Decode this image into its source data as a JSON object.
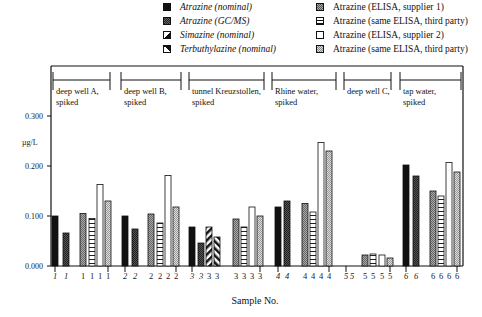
{
  "chart_data": {
    "type": "bar",
    "title": "",
    "xlabel": "Sample No.",
    "ylabel": "µg/L",
    "ylim": [
      0,
      0.3
    ],
    "yticks": [
      "0.000",
      "0.100",
      "0.200",
      "0.300"
    ],
    "grid": false,
    "legend_position": "top-right",
    "legend": [
      {
        "key": "atr_nom",
        "label": "Atrazine (nominal)",
        "italic": true,
        "pattern": "solid-black"
      },
      {
        "key": "atr_gcms",
        "label": "Atrazine (GC/MS)",
        "italic": true,
        "pattern": "dark-checker"
      },
      {
        "key": "sim_nom",
        "label": "Simazine (nominal)",
        "italic": true,
        "pattern": "diagonal-white-black"
      },
      {
        "key": "terb_nom",
        "label": "Terbuthylazine (nominal)",
        "italic": true,
        "pattern": "diagonal-reverse"
      },
      {
        "key": "elisa1",
        "label": "Atrazine (ELISA, supplier 1)",
        "italic": false,
        "pattern": "gray-checker"
      },
      {
        "key": "elisa1_3p",
        "label": "Atrazine (same ELISA, third party)",
        "italic": false,
        "pattern": "horizontal-lines"
      },
      {
        "key": "elisa2",
        "label": "Atrazine (ELISA, supplier 2)",
        "italic": false,
        "pattern": "white"
      },
      {
        "key": "elisa2_3p",
        "label": "Atrazine (same ELISA, third party)",
        "italic": false,
        "pattern": "light-checker"
      }
    ],
    "groups": [
      {
        "sample": "1",
        "label_line1": "deep well A,",
        "label_line2": "spiked",
        "bars": {
          "atr_nom": 0.1,
          "atr_gcms": 0.066,
          "elisa1": 0.105,
          "elisa1_3p": 0.095,
          "elisa2": 0.163,
          "elisa2_3p": 0.13
        }
      },
      {
        "sample": "2",
        "label_line1": "deep well B,",
        "label_line2": "spiked",
        "bars": {
          "atr_nom": 0.1,
          "atr_gcms": 0.074,
          "elisa1": 0.104,
          "elisa1_3p": 0.086,
          "elisa2": 0.181,
          "elisa2_3p": 0.118
        }
      },
      {
        "sample": "3",
        "label_line1": "tunnel Kreuzstollen,",
        "label_line2": "spiked",
        "bars": {
          "atr_nom": 0.078,
          "atr_gcms": 0.046,
          "sim_nom": 0.078,
          "terb_nom": 0.058,
          "elisa1": 0.094,
          "elisa1_3p": 0.078,
          "elisa2": 0.118,
          "elisa2_3p": 0.1
        }
      },
      {
        "sample": "4",
        "label_line1": "Rhine water,",
        "label_line2": "spiked",
        "bars": {
          "atr_nom": 0.118,
          "atr_gcms": 0.13,
          "elisa1": 0.125,
          "elisa1_3p": 0.108,
          "elisa2": 0.247,
          "elisa2_3p": 0.23
        }
      },
      {
        "sample": "5",
        "label_line1": "deep well C,",
        "label_line2": "",
        "bars": {
          "elisa1": 0.022,
          "elisa1_3p": 0.024,
          "elisa2": 0.022,
          "elisa2_3p": 0.016
        }
      },
      {
        "sample": "6",
        "label_line1": "tap water,",
        "label_line2": "spiked",
        "bars": {
          "atr_nom": 0.202,
          "atr_gcms": 0.18,
          "elisa1": 0.15,
          "elisa1_3p": 0.14,
          "elisa2": 0.207,
          "elisa2_3p": 0.188
        }
      }
    ]
  }
}
